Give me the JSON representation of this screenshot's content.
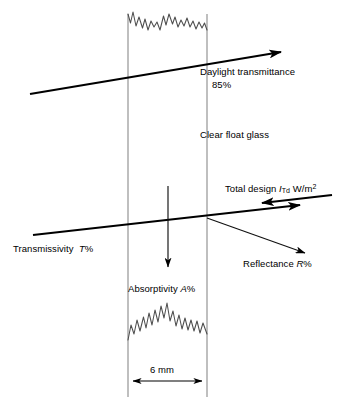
{
  "diagram": {
    "type": "technical-illustration",
    "canvas": {
      "width": 345,
      "height": 409
    },
    "colors": {
      "background": "#ffffff",
      "stroke": "#000000",
      "pane_edge": "#808080",
      "thin_stroke": "#1a1a1a"
    },
    "glass": {
      "material_label": "Clear float glass",
      "thickness_label": "6 mm",
      "left_edge_x": 128,
      "right_edge_x": 207
    },
    "labels": {
      "daylight_transmittance": "Daylight transmittance",
      "daylight_transmittance_value": "85%",
      "clear_float_glass": "Clear float glass",
      "total_design_prefix": "Total design",
      "total_design_symbol": "I",
      "total_design_subscript": "Td",
      "total_design_units_main": "W/m",
      "total_design_units_exponent": "2",
      "transmissivity_prefix": "Transmissivity",
      "transmissivity_symbol": "T",
      "transmissivity_suffix": "%",
      "reflectance_prefix": "Reflectance",
      "reflectance_symbol": "R",
      "reflectance_suffix": "%",
      "absorptivity_prefix": "Absorptivity",
      "absorptivity_symbol": "A",
      "absorptivity_suffix": "%",
      "thickness": "6 mm"
    },
    "rays": [
      {
        "name": "daylight-transmittance-ray",
        "description": "thick ray exiting to the upper-left, arrowhead at left end",
        "from": [
          281,
          52
        ],
        "to": [
          24,
          95
        ],
        "weight": "thick",
        "arrow_end": "start"
      },
      {
        "name": "total-design-incident-ray",
        "description": "incident solar radiation arriving from upper right",
        "from": [
          332,
          196
        ],
        "to": [
          256,
          204
        ],
        "weight": "thick",
        "arrow_end": "end"
      },
      {
        "name": "transmissivity-ray",
        "description": "thick transmitted ray exiting to the left, arrowhead at left end",
        "from": [
          300,
          206
        ],
        "to": [
          26,
          236
        ],
        "weight": "thick",
        "arrow_end": "start"
      },
      {
        "name": "reflectance-ray",
        "description": "thin reflected ray leaving the outer glass face towards lower right",
        "from": [
          207,
          218
        ],
        "to": [
          311,
          256
        ],
        "weight": "thin",
        "arrow_end": "end"
      },
      {
        "name": "absorptivity-ray",
        "description": "thin vertical arrow inside the pane pointing down",
        "from": [
          168,
          186
        ],
        "to": [
          168,
          273
        ],
        "weight": "thin",
        "arrow_end": "end"
      }
    ],
    "dimension": {
      "name": "thickness-dimension",
      "y": 381,
      "from_x": 128,
      "to_x": 207,
      "text": "6 mm"
    }
  }
}
